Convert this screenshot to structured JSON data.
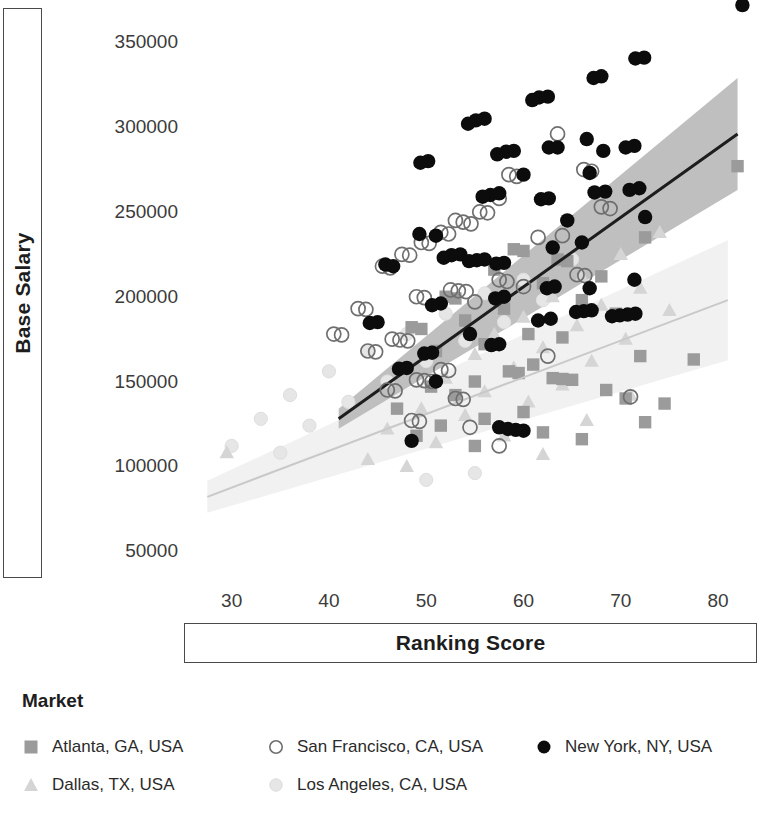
{
  "axes": {
    "y_title": "Base Salary",
    "x_title": "Ranking Score",
    "y_ticks": [
      "350000",
      "300000",
      "250000",
      "200000",
      "150000",
      "100000",
      "50000"
    ],
    "x_ticks": [
      "30",
      "40",
      "50",
      "60",
      "70",
      "80"
    ]
  },
  "legend": {
    "title": "Market",
    "items": [
      {
        "label": "Atlanta, GA, USA",
        "marker": "square-marker",
        "color": "#9b9b9b"
      },
      {
        "label": "Dallas, TX, USA",
        "marker": "triangle-marker",
        "color": "#d5d5d5"
      },
      {
        "label": "San Francisco, CA, USA",
        "marker": "open-circle-marker",
        "color": "#6f6f6f"
      },
      {
        "label": "Los Angeles, CA, USA",
        "marker": "faint-circle-marker",
        "color": "#e6e6e6"
      },
      {
        "label": "New York, NY, USA",
        "marker": "filled-circle-marker",
        "color": "#0c0c0c"
      }
    ]
  },
  "chart_data": {
    "type": "scatter",
    "title": "",
    "xlabel": "Ranking Score",
    "ylabel": "Base Salary",
    "xlim": [
      25,
      84
    ],
    "ylim": [
      30000,
      375000
    ],
    "xticks": [
      30,
      40,
      50,
      60,
      70,
      80
    ],
    "yticks": [
      50000,
      100000,
      150000,
      200000,
      250000,
      300000,
      350000
    ],
    "grid": false,
    "legend_position": "bottom-left",
    "legend_title": "Market",
    "series": [
      {
        "name": "New York, NY, USA",
        "marker": "filled-circle",
        "color": "#0c0c0c",
        "points": [
          [
            82.5,
            372000
          ],
          [
            72.4,
            341000
          ],
          [
            71.5,
            340500
          ],
          [
            68.0,
            330000
          ],
          [
            67.2,
            329000
          ],
          [
            62.5,
            318000
          ],
          [
            61.6,
            317500
          ],
          [
            60.9,
            316000
          ],
          [
            56.0,
            305000
          ],
          [
            55.1,
            304000
          ],
          [
            54.3,
            302000
          ],
          [
            66.5,
            293000
          ],
          [
            63.5,
            288000
          ],
          [
            62.6,
            288000
          ],
          [
            71.4,
            289000
          ],
          [
            70.5,
            288000
          ],
          [
            68.2,
            286000
          ],
          [
            59.0,
            286000
          ],
          [
            58.2,
            285500
          ],
          [
            57.3,
            284000
          ],
          [
            50.2,
            280000
          ],
          [
            49.4,
            279000
          ],
          [
            60.0,
            272000
          ],
          [
            66.8,
            273000
          ],
          [
            71.9,
            264000
          ],
          [
            70.9,
            263000
          ],
          [
            68.4,
            262000
          ],
          [
            67.3,
            261500
          ],
          [
            57.5,
            261000
          ],
          [
            56.6,
            260000
          ],
          [
            55.8,
            259000
          ],
          [
            62.6,
            258000
          ],
          [
            61.8,
            257500
          ],
          [
            72.5,
            247000
          ],
          [
            64.5,
            245000
          ],
          [
            49.3,
            237000
          ],
          [
            51.0,
            236000
          ],
          [
            66.0,
            232000
          ],
          [
            63.0,
            229000
          ],
          [
            53.5,
            225000
          ],
          [
            52.6,
            224500
          ],
          [
            51.8,
            223000
          ],
          [
            56.0,
            222000
          ],
          [
            55.2,
            221500
          ],
          [
            54.4,
            221000
          ],
          [
            58.0,
            220000
          ],
          [
            57.2,
            219500
          ],
          [
            45.8,
            219000
          ],
          [
            46.6,
            218000
          ],
          [
            71.4,
            210000
          ],
          [
            63.2,
            206000
          ],
          [
            62.4,
            205000
          ],
          [
            66.8,
            205000
          ],
          [
            58.0,
            200000
          ],
          [
            57.1,
            199000
          ],
          [
            51.5,
            196000
          ],
          [
            50.6,
            195000
          ],
          [
            67.0,
            192000
          ],
          [
            66.2,
            191500
          ],
          [
            65.4,
            191000
          ],
          [
            71.5,
            190000
          ],
          [
            70.7,
            189500
          ],
          [
            69.9,
            189000
          ],
          [
            69.1,
            188500
          ],
          [
            61.5,
            186000
          ],
          [
            62.8,
            187000
          ],
          [
            45.0,
            185000
          ],
          [
            44.2,
            184500
          ],
          [
            54.5,
            178000
          ],
          [
            57.5,
            172000
          ],
          [
            56.7,
            171500
          ],
          [
            50.6,
            167000
          ],
          [
            49.8,
            166500
          ],
          [
            48.0,
            158000
          ],
          [
            47.2,
            157500
          ],
          [
            51.0,
            150000
          ],
          [
            57.5,
            123000
          ],
          [
            58.4,
            122000
          ],
          [
            59.2,
            121500
          ],
          [
            60.0,
            121000
          ],
          [
            48.5,
            115000
          ]
        ]
      },
      {
        "name": "San Francisco, CA, USA",
        "marker": "open-circle",
        "color": "#6f6f6f",
        "points": [
          [
            63.5,
            296000
          ],
          [
            66.2,
            275000
          ],
          [
            67.0,
            274000
          ],
          [
            58.5,
            272000
          ],
          [
            59.3,
            271000
          ],
          [
            57.5,
            258000
          ],
          [
            68.0,
            253000
          ],
          [
            68.9,
            252000
          ],
          [
            55.5,
            250000
          ],
          [
            56.3,
            249500
          ],
          [
            53.0,
            245000
          ],
          [
            53.8,
            244000
          ],
          [
            54.6,
            243000
          ],
          [
            51.5,
            238000
          ],
          [
            52.3,
            237000
          ],
          [
            64.0,
            236000
          ],
          [
            61.5,
            235000
          ],
          [
            49.5,
            232000
          ],
          [
            50.3,
            231500
          ],
          [
            47.5,
            225000
          ],
          [
            48.3,
            224500
          ],
          [
            45.5,
            218000
          ],
          [
            46.3,
            217000
          ],
          [
            65.5,
            213000
          ],
          [
            66.3,
            212500
          ],
          [
            57.5,
            210000
          ],
          [
            58.3,
            209000
          ],
          [
            60.0,
            206000
          ],
          [
            52.5,
            204000
          ],
          [
            53.3,
            203500
          ],
          [
            54.1,
            203000
          ],
          [
            49.0,
            200000
          ],
          [
            49.8,
            199500
          ],
          [
            55.0,
            197000
          ],
          [
            43.0,
            193000
          ],
          [
            43.8,
            192500
          ],
          [
            40.5,
            178000
          ],
          [
            41.3,
            177500
          ],
          [
            46.5,
            175000
          ],
          [
            47.3,
            174500
          ],
          [
            48.1,
            174000
          ],
          [
            44.0,
            168000
          ],
          [
            44.8,
            167500
          ],
          [
            62.5,
            165000
          ],
          [
            51.5,
            157000
          ],
          [
            52.3,
            156500
          ],
          [
            49.0,
            151000
          ],
          [
            49.8,
            150500
          ],
          [
            50.6,
            150000
          ],
          [
            46.0,
            145000
          ],
          [
            46.8,
            144500
          ],
          [
            71.0,
            141000
          ],
          [
            53.0,
            140000
          ],
          [
            53.8,
            139500
          ],
          [
            48.5,
            127000
          ],
          [
            49.3,
            126500
          ],
          [
            54.5,
            123000
          ],
          [
            57.5,
            112000
          ]
        ]
      },
      {
        "name": "Atlanta, GA, USA",
        "marker": "square",
        "color": "#9b9b9b",
        "points": [
          [
            82.0,
            277000
          ],
          [
            72.5,
            235000
          ],
          [
            59.0,
            228000
          ],
          [
            60.0,
            227000
          ],
          [
            63.5,
            222000
          ],
          [
            64.5,
            221000
          ],
          [
            57.0,
            216000
          ],
          [
            68.0,
            212000
          ],
          [
            62.0,
            208000
          ],
          [
            52.0,
            200000
          ],
          [
            53.0,
            199000
          ],
          [
            66.0,
            198000
          ],
          [
            58.0,
            193000
          ],
          [
            69.5,
            190000
          ],
          [
            54.0,
            186000
          ],
          [
            48.5,
            182000
          ],
          [
            49.5,
            181000
          ],
          [
            60.5,
            178000
          ],
          [
            64.0,
            176000
          ],
          [
            56.0,
            172000
          ],
          [
            51.0,
            168000
          ],
          [
            72.0,
            165000
          ],
          [
            77.5,
            163000
          ],
          [
            61.0,
            160000
          ],
          [
            58.5,
            156000
          ],
          [
            59.5,
            155000
          ],
          [
            63.0,
            152000
          ],
          [
            64.0,
            151500
          ],
          [
            65.0,
            151000
          ],
          [
            55.0,
            150000
          ],
          [
            50.5,
            147000
          ],
          [
            68.5,
            145000
          ],
          [
            53.0,
            142000
          ],
          [
            70.5,
            140000
          ],
          [
            74.5,
            137000
          ],
          [
            47.0,
            134000
          ],
          [
            60.0,
            132000
          ],
          [
            56.0,
            128000
          ],
          [
            72.5,
            126000
          ],
          [
            51.5,
            124000
          ],
          [
            62.0,
            120000
          ],
          [
            49.0,
            118000
          ],
          [
            66.0,
            116000
          ],
          [
            55.0,
            112000
          ]
        ]
      },
      {
        "name": "Dallas, TX, USA",
        "marker": "triangle",
        "color": "#d5d5d5",
        "points": [
          [
            74.0,
            238000
          ],
          [
            70.0,
            225000
          ],
          [
            66.0,
            212000
          ],
          [
            72.0,
            205000
          ],
          [
            63.0,
            200000
          ],
          [
            68.0,
            195000
          ],
          [
            75.0,
            192000
          ],
          [
            60.0,
            188000
          ],
          [
            65.5,
            183000
          ],
          [
            57.0,
            178000
          ],
          [
            70.5,
            175000
          ],
          [
            62.0,
            170000
          ],
          [
            55.0,
            166000
          ],
          [
            67.0,
            162000
          ],
          [
            59.0,
            158000
          ],
          [
            52.0,
            152000
          ],
          [
            64.0,
            148000
          ],
          [
            56.0,
            144000
          ],
          [
            71.0,
            142000
          ],
          [
            60.5,
            138000
          ],
          [
            49.5,
            134000
          ],
          [
            54.0,
            130000
          ],
          [
            66.5,
            127000
          ],
          [
            46.0,
            122000
          ],
          [
            58.0,
            118000
          ],
          [
            51.0,
            114000
          ],
          [
            29.5,
            108000
          ],
          [
            62.0,
            107000
          ],
          [
            44.0,
            104000
          ],
          [
            48.0,
            100000
          ]
        ]
      },
      {
        "name": "Los Angeles, CA, USA",
        "marker": "faint-circle",
        "color": "#e6e6e6",
        "points": [
          [
            65.0,
            222000
          ],
          [
            60.0,
            210000
          ],
          [
            56.0,
            202000
          ],
          [
            62.0,
            198000
          ],
          [
            52.0,
            190000
          ],
          [
            58.0,
            185000
          ],
          [
            48.0,
            178000
          ],
          [
            54.0,
            174000
          ],
          [
            44.0,
            168000
          ],
          [
            50.0,
            162000
          ],
          [
            40.0,
            156000
          ],
          [
            46.0,
            150000
          ],
          [
            36.0,
            142000
          ],
          [
            42.0,
            138000
          ],
          [
            33.0,
            128000
          ],
          [
            38.0,
            124000
          ],
          [
            30.0,
            112000
          ],
          [
            35.0,
            108000
          ],
          [
            55.0,
            96000
          ],
          [
            50.0,
            92000
          ]
        ]
      }
    ],
    "trend_lines": [
      {
        "name": "dark-regression-line",
        "color": "#1d1d1d",
        "band_color": "#b8b8b8",
        "x_start": 41.0,
        "y_start": 128000,
        "x_end": 82.0,
        "y_end": 296000,
        "band_lower_start": 40.8,
        "band_upper_start": 40.8,
        "note": "steep dark trend with shaded confidence band widening to the right"
      },
      {
        "name": "light-regression-line",
        "color": "#c9c9c9",
        "band_color": "#efefef",
        "x_start": 27.5,
        "y_start": 82000,
        "x_end": 81.0,
        "y_end": 198000,
        "note": "shallow light trend with very faint confidence band"
      }
    ]
  }
}
